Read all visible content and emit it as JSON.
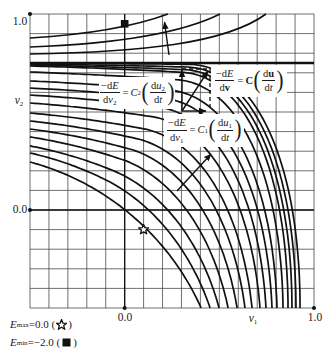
{
  "figure": {
    "axes": {
      "y_max_label": "1.0",
      "y_axis_var": "v",
      "y_axis_sub": "2",
      "y_zero_label": "0.0",
      "x_zero_label": "0.0",
      "x_axis_var": "v",
      "x_axis_sub": "1",
      "x_max_label": "1.0",
      "x_range": [
        -0.5,
        1.0
      ],
      "y_range": [
        -0.5,
        1.0
      ],
      "grid_step": 0.1
    },
    "markers": {
      "maximum": {
        "icon": "star-outline-icon",
        "position": [
          0.1,
          -0.1
        ]
      },
      "minimum": {
        "icon": "filled-square-icon",
        "position": [
          0.0,
          0.95
        ]
      }
    }
  },
  "equations": [
    {
      "lhs_num": [
        "−d",
        "E"
      ],
      "lhs_den": [
        "d",
        "v",
        "2"
      ],
      "equals": "=",
      "coef": [
        "C",
        "2"
      ],
      "open": "(",
      "rhs_num": [
        "d",
        "u",
        "2"
      ],
      "rhs_den": [
        "d",
        "t"
      ],
      "close": ")"
    },
    {
      "lhs_num": [
        "−d",
        "E"
      ],
      "lhs_den": [
        "d",
        "v"
      ],
      "equals": "=",
      "coef": [
        "C"
      ],
      "open": "(",
      "rhs_num": [
        "d",
        "u"
      ],
      "rhs_den": [
        "d",
        "t"
      ],
      "close": ")"
    },
    {
      "lhs_num": [
        "−d",
        "E"
      ],
      "lhs_den": [
        "d",
        "v",
        "1"
      ],
      "equals": "=",
      "coef": [
        "C",
        "1"
      ],
      "open": "(",
      "rhs_num": [
        "d",
        "u",
        "1"
      ],
      "rhs_den": [
        "d",
        "t"
      ],
      "close": ")"
    }
  ],
  "legend": [
    {
      "var": "E",
      "sub": "max",
      "text": "=0.0 (",
      "icon": "star-outline-icon",
      "close": ")"
    },
    {
      "var": "E",
      "sub": "min",
      "text": "=−2.0 (",
      "icon": "filled-square-icon",
      "close": ")"
    }
  ]
}
